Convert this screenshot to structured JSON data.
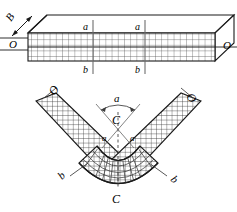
{
  "figure": {
    "stroke_color": "#1a1a1a",
    "grid_color": "#3a3a3a",
    "face_fill": "#ffffff",
    "top_view": {
      "name": "straight-bar",
      "labels": {
        "thickness": "B",
        "left_axis": "O",
        "right_axis": "O",
        "section_top_left": "a",
        "section_top_right": "a",
        "section_bottom_left": "b",
        "section_bottom_right": "b"
      },
      "grid": {
        "columns": 30,
        "rows": 5
      }
    },
    "bottom_view": {
      "name": "bent-bar",
      "labels": {
        "arm_left_end": "O",
        "arm_right_end": "O",
        "arc_top": "a",
        "center": "C",
        "inner_left": "a",
        "inner_right": "a",
        "outer_left": "b",
        "outer_right": "b",
        "axis_bottom": "C"
      },
      "grid": {
        "columns": 26,
        "rows": 5
      }
    }
  }
}
